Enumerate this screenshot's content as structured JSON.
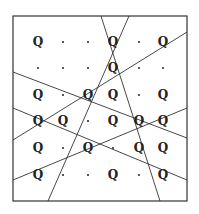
{
  "diagram": {
    "frame": {
      "x1": 13,
      "y1": 16,
      "x2": 187,
      "y2": 201
    },
    "stroke_color": "#333333",
    "glyph_color": "#222222",
    "grid": {
      "columns_x": [
        38,
        63,
        88,
        113,
        139,
        163
      ],
      "rows_y": [
        42,
        68,
        95,
        121,
        148,
        175
      ],
      "cells": [
        [
          "Q",
          ".",
          ".",
          "Q",
          ".",
          "Q"
        ],
        [
          ".",
          ".",
          ".",
          "Q",
          ".",
          "."
        ],
        [
          "Q",
          ".",
          "Q",
          "Q",
          ".",
          "Q"
        ],
        [
          "Q",
          "Q",
          ".",
          "Q",
          "Q",
          "Q"
        ],
        [
          "Q",
          ".",
          "Q",
          ".",
          "Q",
          "Q"
        ],
        [
          "Q",
          ".",
          ".",
          "Q",
          ".",
          "Q"
        ]
      ]
    },
    "lines": [
      {
        "x1": 101,
        "y1": 16,
        "x2": 160,
        "y2": 201
      },
      {
        "x1": 129,
        "y1": 16,
        "x2": 48,
        "y2": 201
      },
      {
        "x1": 13,
        "y1": 72,
        "x2": 187,
        "y2": 138
      },
      {
        "x1": 13,
        "y1": 108,
        "x2": 187,
        "y2": 180
      },
      {
        "x1": 13,
        "y1": 140,
        "x2": 187,
        "y2": 32
      },
      {
        "x1": 13,
        "y1": 180,
        "x2": 187,
        "y2": 108
      }
    ]
  }
}
